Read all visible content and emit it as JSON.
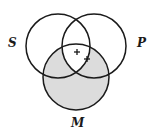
{
  "diagram": {
    "type": "venn-3-set",
    "sets": [
      {
        "label": "S",
        "cx": 58,
        "cy": 46,
        "r": 32
      },
      {
        "label": "P",
        "cx": 94,
        "cy": 46,
        "r": 32
      },
      {
        "label": "M",
        "cx": 76,
        "cy": 77,
        "r": 33
      }
    ],
    "labels": {
      "s": "S",
      "p": "P",
      "m": "M"
    },
    "marks": [
      {
        "symbol": "+",
        "x": 77,
        "y": 52
      },
      {
        "symbol": "+",
        "x": 87,
        "y": 59
      }
    ],
    "colors": {
      "stroke": "#1a1a1a",
      "shade": "#dcdcdc",
      "background": "#ffffff"
    },
    "shaded_regions": [
      "M only",
      "S∩M only",
      "P∩M only"
    ]
  }
}
